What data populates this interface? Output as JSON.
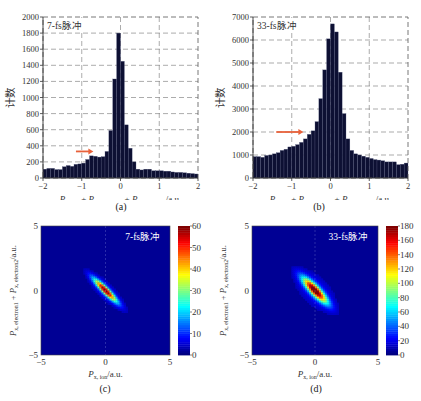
{
  "chart_data": [
    {
      "id": "a",
      "type": "bar",
      "caption": "(a)",
      "annotation": "7-fs脉冲",
      "xlabel": "P_{x, ion} + P_{x, electron1} + P_{x, electron2}/a.u.",
      "ylabel": "计数",
      "xlim": [
        -2,
        2
      ],
      "ylim": [
        0,
        2000
      ],
      "xticks": [
        -2,
        -1,
        0,
        1,
        2
      ],
      "yticks": [
        0,
        200,
        400,
        600,
        800,
        1000,
        1200,
        1400,
        1600,
        1800,
        2000
      ],
      "grid": "dashed",
      "bin_width": 0.1,
      "bin_start": -2,
      "values": [
        110,
        120,
        120,
        105,
        105,
        140,
        155,
        145,
        170,
        175,
        185,
        230,
        275,
        270,
        260,
        265,
        330,
        590,
        1230,
        1800,
        1450,
        660,
        370,
        200,
        110,
        100,
        110,
        110,
        90,
        90,
        90,
        85,
        85,
        75,
        70,
        70,
        65,
        60,
        55,
        50
      ],
      "arrow": {
        "x_from": -1.15,
        "x_to": -0.7,
        "y": 330,
        "color": "#e8613a"
      }
    },
    {
      "id": "b",
      "type": "bar",
      "caption": "(b)",
      "annotation": "33-fs脉冲",
      "xlabel": "P_{x, ion} + P_{x, electron1} + P_{x, electron2}/a.u.",
      "ylabel": "计数",
      "xlim": [
        -2,
        2
      ],
      "ylim": [
        0,
        7000
      ],
      "xticks": [
        -2,
        -1,
        0,
        1,
        2
      ],
      "yticks": [
        0,
        1000,
        2000,
        3000,
        4000,
        5000,
        6000,
        7000
      ],
      "grid": "dashed",
      "bin_width": 0.1,
      "bin_start": -2,
      "values": [
        930,
        930,
        900,
        980,
        1000,
        1050,
        1100,
        1200,
        1250,
        1350,
        1380,
        1450,
        1550,
        1700,
        1900,
        2050,
        2450,
        3450,
        4700,
        6050,
        6700,
        6350,
        4600,
        2800,
        1700,
        1200,
        1050,
        1000,
        950,
        900,
        850,
        800,
        780,
        750,
        700,
        700,
        700,
        580,
        600,
        650
      ],
      "arrow": {
        "x_from": -1.4,
        "x_to": -0.7,
        "y": 2000,
        "color": "#e8613a"
      }
    },
    {
      "id": "c",
      "type": "heatmap",
      "caption": "(c)",
      "annotation": "7-fs脉冲",
      "xlabel": "P_{x, ion}/a.u.",
      "ylabel": "P_{x, electron1} + P_{x, electron2}/a.u.",
      "xlim": [
        -5,
        5
      ],
      "ylim": [
        -5,
        5
      ],
      "xticks": [
        -5,
        0,
        5
      ],
      "yticks": [
        -5,
        0,
        5
      ],
      "colorbar": {
        "min": 0,
        "max": 60,
        "ticks": [
          0,
          10,
          20,
          30,
          40,
          50,
          60
        ],
        "colormap": "jet"
      },
      "feature": "narrow anti-diagonal ridge from (-1.5,1.5) to (1.5,-1.5), peak ~55 near origin"
    },
    {
      "id": "d",
      "type": "heatmap",
      "caption": "(d)",
      "annotation": "33-fs脉冲",
      "xlabel": "P_{x, ion}/a.u.",
      "ylabel": "P_{x, electron1} + P_{x, electron2}/a.u.",
      "xlim": [
        -5,
        5
      ],
      "ylim": [
        -5,
        5
      ],
      "xticks": [
        -5,
        0,
        5
      ],
      "yticks": [
        -5,
        0,
        5
      ],
      "colorbar": {
        "min": 0,
        "max": 180,
        "ticks": [
          0,
          20,
          40,
          60,
          80,
          100,
          120,
          140,
          160,
          180
        ],
        "colormap": "jet"
      },
      "feature": "wider anti-diagonal ridge from (-1.6,1.6) to (1.6,-1.6), peak ~170 near origin"
    }
  ],
  "labels": {
    "a_caption": "(a)",
    "b_caption": "(b)",
    "c_caption": "(c)",
    "d_caption": "(d)",
    "a_note": "7-fs脉冲",
    "b_note": "33-fs脉冲",
    "c_note": "7-fs脉冲",
    "d_note": "33-fs脉冲",
    "ylabel_count": "计数"
  }
}
